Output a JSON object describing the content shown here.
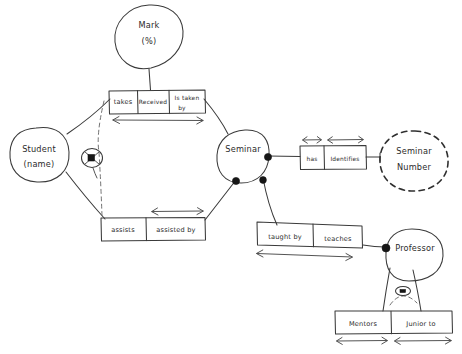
{
  "diagram": {
    "kind": "hand-drawn-entity-relationship-diagram",
    "background_color": "#ffffff",
    "ink_color": "#3a3a3a",
    "entities": [
      {
        "id": "student",
        "label_line1": "Student",
        "label_line2": "(name)",
        "shape": "oval",
        "border": "solid"
      },
      {
        "id": "mark",
        "label_line1": "Mark",
        "label_line2": "(%)",
        "shape": "oval",
        "border": "solid"
      },
      {
        "id": "seminar",
        "label_line1": "Seminar",
        "label_line2": "",
        "shape": "oval",
        "border": "solid"
      },
      {
        "id": "seminar-number",
        "label_line1": "Seminar",
        "label_line2": "Number",
        "shape": "oval",
        "border": "dashed"
      },
      {
        "id": "professor",
        "label_line1": "Professor",
        "label_line2": "",
        "shape": "oval",
        "border": "solid"
      }
    ],
    "relationships": [
      {
        "id": "takes-received-is-taken-by",
        "cells": [
          {
            "label": "takes"
          },
          {
            "label": "Received"
          },
          {
            "label": "Is taken by"
          }
        ]
      },
      {
        "id": "assists-assisted-by",
        "cells": [
          {
            "label": "assists"
          },
          {
            "label": "assisted by"
          }
        ]
      },
      {
        "id": "has-identifies",
        "cells": [
          {
            "label": "has"
          },
          {
            "label": "Identifies"
          }
        ]
      },
      {
        "id": "taught-by-teaches",
        "cells": [
          {
            "label": "taught by"
          },
          {
            "label": "teaches"
          }
        ]
      },
      {
        "id": "mentors-junior-to",
        "cells": [
          {
            "label": "Mentors"
          },
          {
            "label": "Junior to"
          }
        ]
      }
    ],
    "markers": [
      {
        "id": "exclusive-arc-student",
        "type": "crossed-circle"
      },
      {
        "id": "exclusive-arc-professor",
        "type": "crossed-circle"
      }
    ]
  }
}
